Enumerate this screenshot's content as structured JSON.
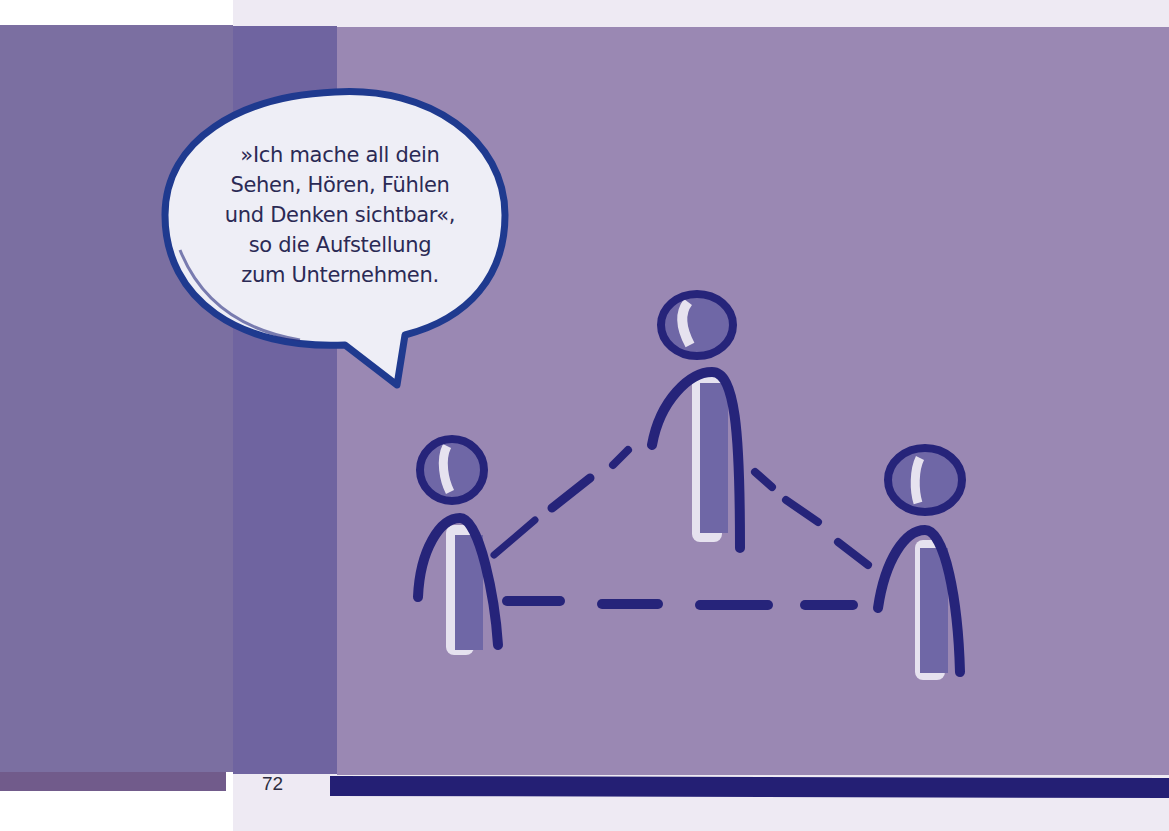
{
  "page": {
    "number": "72",
    "colors": {
      "band_left": "#7b6fa1",
      "band_mid": "#6f64a0",
      "band_main": "#9a88b3",
      "strip_left": "#715b8b",
      "strip_right": "#241f74",
      "ink": "#26247a",
      "paper": "#eeeaf3"
    }
  },
  "speech_bubble": {
    "lines": [
      "»Ich mache all dein",
      "Sehen, Hören, Fühlen",
      "und Denken sichtbar«,",
      "so die Aufstellung",
      "zum Unternehmen."
    ]
  },
  "illustration": {
    "description": "three-stick-figures-connected-by-dashed-triangle",
    "figures": [
      "left-figure",
      "top-figure",
      "right-figure"
    ]
  }
}
